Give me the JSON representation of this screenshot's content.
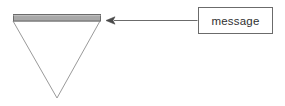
{
  "diagram": {
    "type": "annotated-shape-diagram",
    "background_color": "#ffffff",
    "stroke_color": "#8a8a8a",
    "dark_stroke_color": "#5a5a5a",
    "shapes": {
      "triangle": {
        "name": "inverted-triangle",
        "fill": "none",
        "stroke": "#9a9a9a",
        "stroke_width": 1,
        "points": "13,21 100,21 57,98"
      },
      "shaded_bar": {
        "name": "shaded-top-bar",
        "fill": "#a8a8a8",
        "stroke": "#6b6b6b",
        "stroke_width": 1,
        "x": 13,
        "y": 14,
        "width": 88,
        "height": 7
      },
      "message_box": {
        "name": "message-box",
        "fill": "#ffffff",
        "stroke": "#6b6b6b",
        "stroke_width": 1,
        "x": 198,
        "y": 7,
        "width": 75,
        "height": 27
      }
    },
    "connector": {
      "name": "arrow-connector",
      "stroke": "#6b6b6b",
      "stroke_width": 1,
      "from_x": 198,
      "to_x": 113,
      "y": 21,
      "arrowhead": "solid-left-triangle"
    },
    "labels": {
      "message": "message"
    }
  }
}
